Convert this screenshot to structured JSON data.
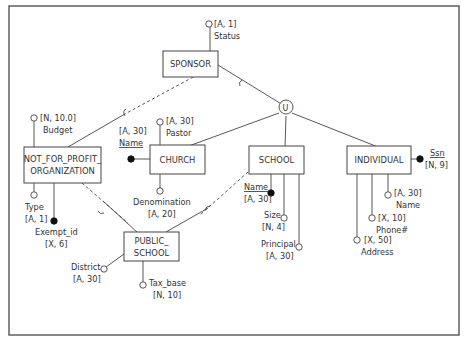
{
  "diagram": {
    "type": "EER diagram",
    "entities": {
      "sponsor": "SPONSOR",
      "nfpo_line1": "NOT_FOR_PROFIT_",
      "nfpo_line2": "ORGANIZATION",
      "church": "CHURCH",
      "school": "SCHOOL",
      "individual": "INDIVIDUAL",
      "public_school_line1": "PUBLIC_",
      "public_school_line2": "SCHOOL"
    },
    "union_symbol": "U",
    "attributes": {
      "sponsor_status": {
        "name": "Status",
        "domain": "[A, 1]"
      },
      "nfpo_budget": {
        "name": "Budget",
        "domain": "[N, 10.0]"
      },
      "nfpo_type": {
        "name": "Type",
        "domain": "[A, 1]"
      },
      "nfpo_exempt_id": {
        "name": "Exempt_id",
        "domain": "[X, 6]"
      },
      "church_name": {
        "name": "Name",
        "domain": "[A, 30]"
      },
      "church_pastor": {
        "name": "Pastor",
        "domain": "[A, 30]"
      },
      "church_denomination": {
        "name": "Denomination",
        "domain": "[A, 20]"
      },
      "school_name": {
        "name": "Name",
        "domain": "[A, 30]"
      },
      "school_size": {
        "name": "Size",
        "domain": "[N, 4]"
      },
      "school_principal": {
        "name": "Principal",
        "domain": "[A, 30]"
      },
      "individual_ssn": {
        "name": "Ssn",
        "domain": "[N, 9]"
      },
      "individual_name": {
        "name": "Name",
        "domain": "[A, 30]"
      },
      "individual_phone": {
        "name": "Phone#",
        "domain": "[X, 10]"
      },
      "individual_address": {
        "name": "Address",
        "domain": "[X, 50]"
      },
      "ps_district": {
        "name": "District",
        "domain": "[A, 30]"
      },
      "ps_tax_base": {
        "name": "Tax_base",
        "domain": "[N, 10]"
      }
    }
  }
}
